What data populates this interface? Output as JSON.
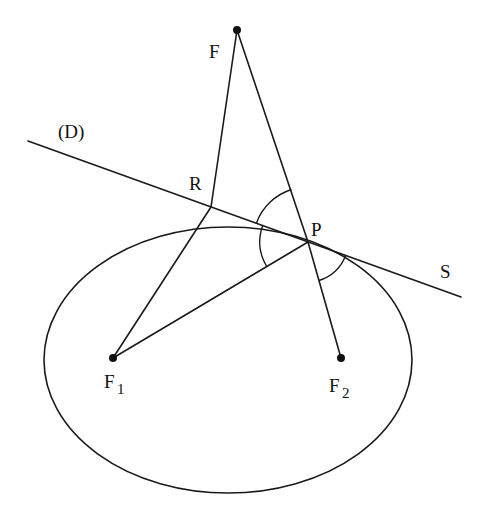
{
  "diagram": {
    "labels": {
      "F": "F",
      "D": "(D)",
      "R": "R",
      "P": "P",
      "S": "S",
      "F1_main": "F",
      "F1_sub": "1",
      "F2_main": "F",
      "F2_sub": "2"
    },
    "points": {
      "F": {
        "x": 237,
        "y": 30
      },
      "R": {
        "x": 211,
        "y": 207
      },
      "P": {
        "x": 308,
        "y": 242
      },
      "F1": {
        "x": 113,
        "y": 358
      },
      "F2": {
        "x": 341,
        "y": 358
      }
    },
    "ellipse": {
      "cx": 228,
      "cy": 360,
      "rx": 184,
      "ry": 133
    },
    "line_D": {
      "x1": 28,
      "y1": 141,
      "x2": 461,
      "y2": 297
    },
    "segments": [
      {
        "from": "F",
        "to": "R"
      },
      {
        "from": "R",
        "to": "F1"
      },
      {
        "from": "F1",
        "to": "P"
      },
      {
        "from": "F",
        "to": "P"
      },
      {
        "from": "P",
        "to": "F2"
      }
    ],
    "angle_marks": [
      {
        "at": "P",
        "between": [
          "F",
          "D-left"
        ]
      },
      {
        "at": "P",
        "between": [
          "D-left",
          "F1"
        ]
      },
      {
        "at": "P",
        "between": [
          "S",
          "F2"
        ]
      }
    ],
    "colors": {
      "stroke": "#1a1a1a",
      "background": "#ffffff"
    }
  }
}
